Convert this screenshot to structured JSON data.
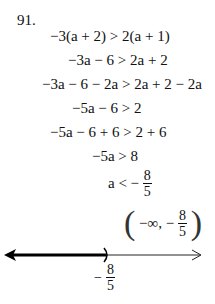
{
  "problem_number": "91.",
  "steps": [
    "−3(a + 2) > 2(a + 1)",
    "−3a − 6 > 2a + 2",
    "−3a − 6 − 2a > 2a + 2 − 2a",
    "−5a − 6 > 2",
    "−5a − 6 + 6 > 2 + 6",
    "−5a > 8"
  ],
  "solution": {
    "lhs": "a < −",
    "numerator": "8",
    "denominator": "5"
  },
  "interval": {
    "open": "(",
    "text": "−∞, −",
    "numerator": "8",
    "denominator": "5",
    "close": ")"
  },
  "number_line": {
    "point_label_sign": "−",
    "point_numerator": "8",
    "point_denominator": "5",
    "endpoint": "open-parenthesis",
    "shaded_direction": "left"
  }
}
